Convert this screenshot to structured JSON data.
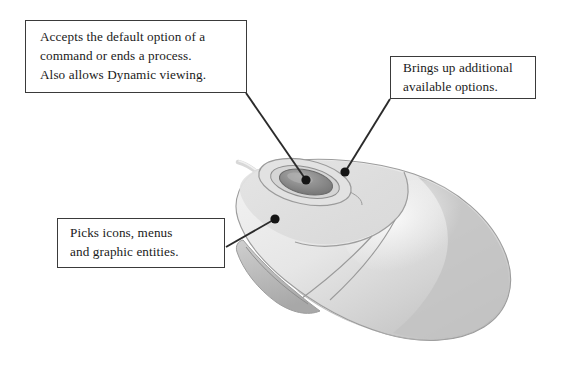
{
  "figure": {
    "background_color": "#ffffff"
  },
  "callouts": [
    {
      "id": "primary-button",
      "name": "callout-primary",
      "lines": [
        "Accepts the default option of a",
        "command or ends a process.",
        "Also allows Dynamic viewing."
      ],
      "border_color": "#3a3a3a",
      "fill_color": "#ffffff"
    },
    {
      "id": "secondary-button",
      "name": "callout-secondary",
      "lines": [
        "Brings up additional",
        "available options."
      ],
      "border_color": "#3a3a3a",
      "fill_color": "#ffffff"
    },
    {
      "id": "pick-button",
      "name": "callout-pick",
      "lines": [
        "Picks icons, menus",
        "and graphic entities."
      ],
      "border_color": "#3a3a3a",
      "fill_color": "#ffffff"
    }
  ],
  "leaders": [
    {
      "id": "leader-primary",
      "from_x": 246,
      "from_y": 93,
      "to_x": 306,
      "to_y": 180,
      "dot_r": 4.6
    },
    {
      "id": "leader-secondary",
      "from_x": 390,
      "from_y": 99,
      "to_x": 345,
      "to_y": 172,
      "dot_r": 4.6
    },
    {
      "id": "leader-pick",
      "from_x": 226,
      "from_y": 247,
      "to_x": 275,
      "to_y": 219,
      "dot_r": 4.6
    }
  ],
  "mouse": {
    "body_fill": "#e9e9e9",
    "body_shade": "#c2c2c2",
    "body_shade_dark": "#b0b0b0",
    "body_highlight": "#f4f4f4",
    "outline": "#8e8e8e",
    "wheel_fill": "#8f8f8f",
    "wheel_outline": "#6d6d6d",
    "wheel_ring": "#9a9a9a",
    "seam": "#9b9b9b",
    "cable": "#d6d6d6",
    "parts": [
      "left-button",
      "right-button",
      "scroll-wheel",
      "wheel-bezel",
      "body-shell",
      "front-lip",
      "cable-stub"
    ]
  },
  "colors": {
    "leader_line": "#2b2b2b",
    "leader_dot": "#151515",
    "text": "#1a1a1a"
  }
}
